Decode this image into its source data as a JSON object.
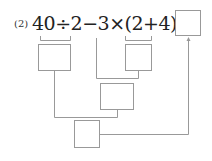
{
  "problem": {
    "number_label": "(2)",
    "expression": "40÷2−3×(2+4)=",
    "steps": [
      {
        "id": "step-40-div-2",
        "covers": "40÷2",
        "value": ""
      },
      {
        "id": "step-2-plus-4",
        "covers": "(2+4)",
        "value": ""
      },
      {
        "id": "step-3-times",
        "covers": "3×(2+4)",
        "value": ""
      },
      {
        "id": "step-subtract",
        "covers": "40÷2−3×(2+4)",
        "value": ""
      }
    ],
    "answer": ""
  }
}
